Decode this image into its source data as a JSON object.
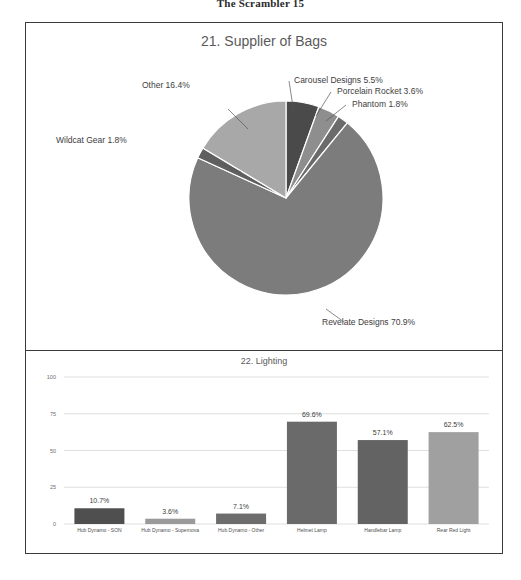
{
  "page": {
    "header": "The Scrambler 15"
  },
  "pie_panel": {
    "title": "21. Supplier of Bags",
    "labels": [
      "Carousel Designs 5.5%",
      "Porcelain Rocket 3.6%",
      "Phantom 1.8%",
      "Revelate Designs 70.9%",
      "Wildcat Gear 1.8%",
      "Other 16.4%"
    ]
  },
  "bar_panel": {
    "title": "22. Lighting",
    "y_ticks": [
      "100",
      "75",
      "50",
      "25",
      "0"
    ],
    "categories": [
      "Hub Dynamo - SON",
      "Hub Dynamo - Supernova",
      "Hub Dynamo - Other",
      "Helmet Lamp",
      "Handlebar Lamp",
      "Rear Red Light"
    ],
    "value_labels": [
      "10.7%",
      "3.6%",
      "7.1%",
      "69.6%",
      "57.1%",
      "62.5%"
    ]
  },
  "chart_data": [
    {
      "type": "pie",
      "title": "21. Supplier of Bags",
      "categories": [
        "Carousel Designs",
        "Porcelain Rocket",
        "Phantom",
        "Revelate Designs",
        "Wildcat Gear",
        "Other"
      ],
      "values": [
        5.5,
        3.6,
        1.8,
        70.9,
        1.8,
        16.4
      ],
      "labels": [
        "Carousel Designs 5.5%",
        "Porcelain Rocket 3.6%",
        "Phantom 1.8%",
        "Revelate Designs 70.9%",
        "Wildcat Gear 1.8%",
        "Other 16.4%"
      ],
      "colors": [
        "#4a4a4a",
        "#8e8e8e",
        "#6b6b6b",
        "#7c7c7c",
        "#5f5f5f",
        "#a8a8a8"
      ],
      "start_angle_deg": 0,
      "direction": "clockwise",
      "legend": "none",
      "grid": false
    },
    {
      "type": "bar",
      "title": "22. Lighting",
      "categories": [
        "Hub Dynamo - SON",
        "Hub Dynamo - Supernova",
        "Hub Dynamo - Other",
        "Helmet Lamp",
        "Handlebar Lamp",
        "Rear Red Light"
      ],
      "values": [
        10.7,
        3.6,
        7.1,
        69.6,
        57.1,
        62.5
      ],
      "data_labels": [
        "10.7%",
        "3.6%",
        "7.1%",
        "69.6%",
        "57.1%",
        "62.5%"
      ],
      "colors": [
        "#4f4f4f",
        "#9a9a9a",
        "#6d6d6d",
        "#6a6a6a",
        "#636363",
        "#a0a0a0"
      ],
      "xlabel": "",
      "ylabel": "",
      "ylim": [
        0,
        100
      ],
      "y_ticks": [
        0,
        25,
        50,
        75,
        100
      ],
      "grid": true,
      "legend": "none"
    }
  ]
}
